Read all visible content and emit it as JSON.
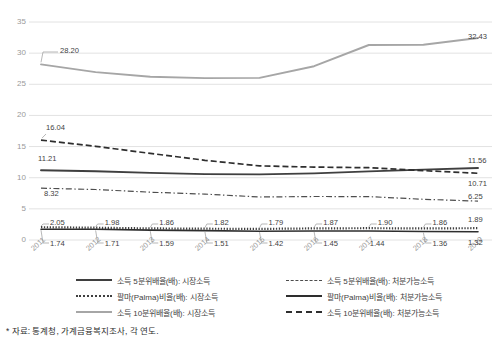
{
  "chart_data": {
    "type": "line",
    "title": "",
    "xlabel": "",
    "ylabel": "",
    "ylim": [
      0,
      35
    ],
    "ytick_values": [
      0,
      5,
      10,
      15,
      20,
      25,
      30,
      35
    ],
    "grid": true,
    "legend_position": "bottom",
    "categories": [
      "2011",
      "2012",
      "2013",
      "2014",
      "2015",
      "2016",
      "2017",
      "2018",
      "2019"
    ],
    "series": [
      {
        "name": "소득 5분위배율(배): 시장소득",
        "style": "solid-thick-dark",
        "color": "#3f3f3f",
        "values": [
          11.21,
          11.05,
          10.78,
          10.58,
          10.53,
          10.7,
          11.01,
          11.3,
          11.56
        ],
        "labels": {
          "2011": "11.21",
          "2019": "11.56"
        }
      },
      {
        "name": "소득 5분위배율(배): 처분가능소득",
        "style": "dash-dot",
        "color": "#4d4d4d",
        "values": [
          8.32,
          8.1,
          7.68,
          7.37,
          6.91,
          6.98,
          6.96,
          6.54,
          6.25
        ],
        "labels": {
          "2011": "8.32",
          "2019": "6.25"
        }
      },
      {
        "name": "팔마(Palma)비율(배): 시장소득",
        "style": "dotted-thick",
        "color": "#3f3f3f",
        "values": [
          2.05,
          1.98,
          1.86,
          1.82,
          1.79,
          1.87,
          1.9,
          1.86,
          1.89
        ],
        "labels": {
          "2011": "2.05",
          "2012": "1.98",
          "2013": "1.86",
          "2014": "1.82",
          "2015": "1.79",
          "2016": "1.87",
          "2017": "1.90",
          "2018": "1.86",
          "2019": "1.89"
        }
      },
      {
        "name": "팔마(Palma)비율(배): 처분가능소득",
        "style": "solid-thin-dark",
        "color": "#2e2e2e",
        "values": [
          1.74,
          1.71,
          1.59,
          1.51,
          1.42,
          1.45,
          1.44,
          1.36,
          1.32
        ],
        "labels": {
          "2011": "1.74",
          "2012": "1.71",
          "2013": "1.59",
          "2014": "1.51",
          "2015": "1.42",
          "2016": "1.45",
          "2017": "1.44",
          "2018": "1.36",
          "2019": "1.32"
        }
      },
      {
        "name": "소득 10분위배율(배): 시장소득",
        "style": "solid-grey",
        "color": "#a6a6a6",
        "values": [
          28.2,
          26.95,
          26.2,
          26.0,
          26.03,
          27.9,
          31.3,
          31.35,
          32.43
        ],
        "labels": {
          "2011": "28.20",
          "2019": "32.43"
        }
      },
      {
        "name": "소득 10분위배율(배): 처분가능소득",
        "style": "dashed",
        "color": "#2e2e2e",
        "values": [
          16.04,
          15.05,
          13.9,
          12.8,
          11.9,
          11.7,
          11.6,
          11.15,
          10.71
        ],
        "labels": {
          "2011": "16.04",
          "2019": "10.71"
        }
      }
    ]
  },
  "axis": {
    "y_ticks": [
      "35",
      "30",
      "25",
      "20",
      "15",
      "10",
      "5",
      "0"
    ],
    "x_ticks": [
      "2011",
      "2012",
      "2013",
      "2014",
      "2015",
      "2016",
      "2017",
      "2018",
      "2019"
    ]
  },
  "data_labels": {
    "top_left": "28.20",
    "top_right": "32.43",
    "mid_dash_left": "16.04",
    "mid_dash_right": "10.71",
    "mid_solid_left": "11.21",
    "mid_solid_right": "11.56",
    "mid_dashdot_left": "8.32",
    "mid_dashdot_right": "6.25",
    "palma_market": [
      "2.05",
      "1.98",
      "1.86",
      "1.82",
      "1.79",
      "1.87",
      "1.90",
      "1.86",
      "1.89"
    ],
    "palma_disposable": [
      "1.74",
      "1.71",
      "1.59",
      "1.51",
      "1.42",
      "1.45",
      "1.44",
      "1.36",
      "1.32"
    ]
  },
  "legend": {
    "left_column": [
      {
        "label": "소득 5분위배율(배): 시장소득",
        "style": "solid-thick-dark"
      },
      {
        "label": "팔마(Palma)비율(배): 시장소득",
        "style": "dotted-thick"
      },
      {
        "label": "소득 10분위배율(배): 시장소득",
        "style": "solid-grey"
      }
    ],
    "right_column": [
      {
        "label": "소득 5분위배율(배): 처분가능소득",
        "style": "dash-dot"
      },
      {
        "label": "팔마(Palma)비율(배): 처분가능소득",
        "style": "solid-thin-dark"
      },
      {
        "label": "소득 10분위배율(배): 처분가능소득",
        "style": "dashed"
      }
    ]
  },
  "footnote": {
    "text": "* 자료: 통계청, 가계금융복지조사, 각 연도."
  },
  "colors": {
    "grey_series": "#a6a6a6",
    "dark_series": "#2e2e2e",
    "gridline": "#e2e2e2",
    "tick_text": "#9a9a9a"
  }
}
